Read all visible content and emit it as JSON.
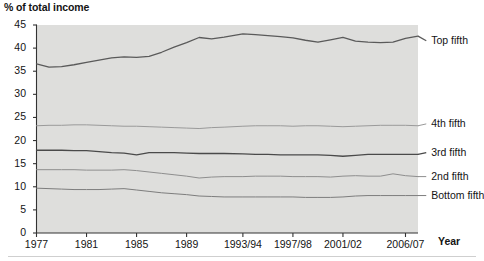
{
  "chart_data": {
    "type": "line",
    "title": "",
    "ylabel": "% of total income",
    "xlabel": "Year",
    "ylim": [
      0,
      45
    ],
    "yticks": [
      0,
      5,
      10,
      15,
      20,
      25,
      30,
      35,
      40,
      45
    ],
    "grid": false,
    "legend_position": "right-inline",
    "plot_background": "#dededc",
    "x_tick_labels": [
      "1977",
      "1981",
      "1985",
      "1989",
      "1993/94",
      "1997/98",
      "2001/02",
      "2006/07"
    ],
    "x_tick_values": [
      1977,
      1981,
      1985,
      1989,
      1993.5,
      1997.5,
      2001.5,
      2006.5
    ],
    "x": [
      1977,
      1978,
      1979,
      1980,
      1981,
      1982,
      1983,
      1984,
      1985,
      1986,
      1987,
      1988,
      1989,
      1990,
      1991,
      1992,
      1993.5,
      1994.5,
      1995.5,
      1996.5,
      1997.5,
      1998.5,
      1999.5,
      2000.5,
      2001.5,
      2002.5,
      2003.5,
      2004.5,
      2005.5,
      2006.5,
      2007.5
    ],
    "series": [
      {
        "name": "Top fifth",
        "color": "#5a5a5a",
        "width": 1.3,
        "label_x": 2008.4,
        "label_y": 41.6,
        "values": [
          36.6,
          35.9,
          36.0,
          36.4,
          36.9,
          37.4,
          37.9,
          38.1,
          38.0,
          38.2,
          39.1,
          40.2,
          41.2,
          42.3,
          42.0,
          42.4,
          43.1,
          42.9,
          42.7,
          42.5,
          42.2,
          41.7,
          41.3,
          41.8,
          42.3,
          41.5,
          41.3,
          41.2,
          41.3,
          42.1,
          42.6
        ]
      },
      {
        "name": "4th fifth",
        "color": "#9a9a9a",
        "width": 1.0,
        "label_x": 2008.4,
        "label_y": 23.6,
        "values": [
          23.2,
          23.3,
          23.3,
          23.4,
          23.4,
          23.3,
          23.2,
          23.1,
          23.1,
          23.0,
          22.9,
          22.8,
          22.7,
          22.6,
          22.8,
          22.9,
          23.1,
          23.2,
          23.2,
          23.2,
          23.1,
          23.2,
          23.2,
          23.1,
          23.0,
          23.1,
          23.2,
          23.3,
          23.3,
          23.3,
          23.2
        ]
      },
      {
        "name": "3rd fifth",
        "color": "#4a4a4a",
        "width": 1.3,
        "label_x": 2008.4,
        "label_y": 17.4,
        "values": [
          17.9,
          17.9,
          17.9,
          17.8,
          17.8,
          17.6,
          17.4,
          17.3,
          16.9,
          17.4,
          17.4,
          17.4,
          17.3,
          17.2,
          17.2,
          17.2,
          17.1,
          17.0,
          17.0,
          16.9,
          16.9,
          16.9,
          16.9,
          16.8,
          16.6,
          16.8,
          17.0,
          17.0,
          17.0,
          17.0,
          17.0
        ]
      },
      {
        "name": "2nd fifth",
        "color": "#8e8e8e",
        "width": 1.0,
        "label_x": 2008.4,
        "label_y": 12.2,
        "values": [
          13.7,
          13.7,
          13.7,
          13.7,
          13.6,
          13.6,
          13.6,
          13.7,
          13.5,
          13.2,
          12.9,
          12.6,
          12.3,
          11.9,
          12.1,
          12.2,
          12.2,
          12.3,
          12.3,
          12.3,
          12.2,
          12.2,
          12.2,
          12.1,
          12.3,
          12.4,
          12.3,
          12.3,
          12.8,
          12.4,
          12.2
        ]
      },
      {
        "name": "Bottom fifth",
        "color": "#7d7d7d",
        "width": 1.0,
        "label_x": 2008.4,
        "label_y": 8.1,
        "values": [
          9.7,
          9.6,
          9.5,
          9.4,
          9.4,
          9.4,
          9.5,
          9.6,
          9.3,
          9.0,
          8.7,
          8.5,
          8.3,
          8.0,
          7.9,
          7.8,
          7.8,
          7.8,
          7.8,
          7.8,
          7.8,
          7.7,
          7.7,
          7.7,
          7.8,
          8.0,
          8.1,
          8.1,
          8.1,
          8.1,
          8.1
        ]
      }
    ]
  },
  "labels": {
    "y_axis_title": "% of total income",
    "x_axis_title": "Year"
  }
}
